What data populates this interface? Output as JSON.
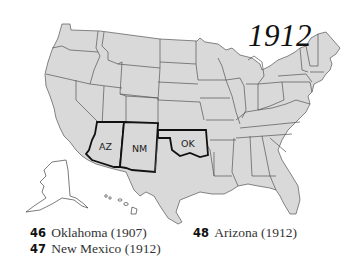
{
  "title": "1912",
  "map": {
    "highlighted_states": [
      {
        "abbr": "AZ",
        "name": "Arizona"
      },
      {
        "abbr": "NM",
        "name": "New Mexico"
      },
      {
        "abbr": "OK",
        "name": "Oklahoma"
      }
    ],
    "colors": {
      "fill": "#d9d9d9",
      "border": "#555555",
      "highlight_border": "#111111",
      "background": "#ffffff"
    }
  },
  "legend": [
    {
      "number": "46",
      "label": "Oklahoma (1907)"
    },
    {
      "number": "47",
      "label": "New Mexico (1912)"
    },
    {
      "number": "48",
      "label": "Arizona (1912)"
    }
  ]
}
